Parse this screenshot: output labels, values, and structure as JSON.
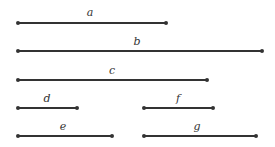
{
  "segments": [
    {
      "label": "a",
      "x1": 18,
      "x2": 166,
      "y": 23,
      "lx": 90,
      "ly": 16
    },
    {
      "label": "b",
      "x1": 18,
      "x2": 262,
      "y": 51,
      "lx": 137,
      "ly": 45
    },
    {
      "label": "c",
      "x1": 18,
      "x2": 207,
      "y": 80,
      "lx": 112,
      "ly": 74
    },
    {
      "label": "d",
      "x1": 18,
      "x2": 77,
      "y": 108,
      "lx": 47,
      "ly": 102
    },
    {
      "label": "e",
      "x1": 18,
      "x2": 112,
      "y": 136,
      "lx": 63,
      "ly": 130
    },
    {
      "label": "f",
      "x1": 144,
      "x2": 213,
      "y": 108,
      "lx": 178,
      "ly": 102
    },
    {
      "label": "g",
      "x1": 144,
      "x2": 256,
      "y": 136,
      "lx": 197,
      "ly": 130
    }
  ],
  "style": {
    "line_color": "#333333",
    "stroke_width": 2,
    "dot_radius": 2
  }
}
